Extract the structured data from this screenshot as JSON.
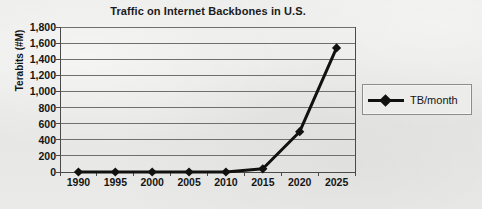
{
  "chart_data": {
    "type": "line",
    "title": "Traffic on Internet Backbones in U.S.",
    "xlabel": "",
    "ylabel": "Terabits (#M)",
    "categories": [
      "1990",
      "1995",
      "2000",
      "2005",
      "2010",
      "2015",
      "2020",
      "2025"
    ],
    "series": [
      {
        "name": "TB/month",
        "values": [
          0,
          0,
          0,
          0,
          0,
          40,
          500,
          1540
        ]
      }
    ],
    "ylim": [
      0,
      1800
    ],
    "ytick_step": 200,
    "ytick_labels": [
      "1,800",
      "1,600",
      "1,400",
      "1,200",
      "1,000",
      "800",
      "600",
      "400",
      "200",
      "0"
    ],
    "ytick_values": [
      1800,
      1600,
      1400,
      1200,
      1000,
      800,
      600,
      400,
      200,
      0
    ],
    "grid": "horizontal",
    "legend_position": "right",
    "marker": "diamond",
    "series_color": "#111111",
    "gridline_color": "#6f6f6f",
    "axis_color": "#4a4a4a",
    "background_color": "#e9e9e7"
  },
  "legend": {
    "entries": [
      {
        "label": "TB/month",
        "marker": "diamond-marker-icon"
      }
    ]
  }
}
